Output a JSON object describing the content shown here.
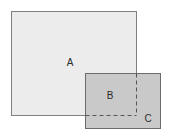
{
  "figure": {
    "background_color": "#ffffff",
    "width": 172,
    "height": 134
  },
  "chart_data": {
    "type": "diagram",
    "shapes": [
      {
        "id": "rect-a",
        "label": "A",
        "kind": "rectangle",
        "x": 11,
        "y": 11,
        "width": 125,
        "height": 104,
        "fill": "#ececec",
        "stroke": "#808080",
        "stroke_width": 1,
        "stroke_style": "solid"
      },
      {
        "id": "rect-bc",
        "label": "C",
        "kind": "rectangle",
        "x": 85,
        "y": 73,
        "width": 75,
        "height": 55,
        "fill": "#c9c9c9",
        "stroke": "#6b6b6b",
        "stroke_width": 1,
        "stroke_style": "solid"
      }
    ],
    "overlap_region": {
      "id": "region-b",
      "label": "B",
      "x": 85,
      "y": 73,
      "width": 51,
      "height": 42,
      "boundary_style": "dashed",
      "boundary_color": "#555555"
    },
    "dashed_lines": [
      {
        "id": "dashed-vertical",
        "orientation": "vertical",
        "x1": 136,
        "y1": 73,
        "x2": 136,
        "y2": 115,
        "color": "#555555",
        "dash_pattern": "4,3"
      },
      {
        "id": "dashed-horizontal",
        "orientation": "horizontal",
        "x1": 85,
        "y1": 115,
        "x2": 136,
        "y2": 115,
        "color": "#555555",
        "dash_pattern": "4,3"
      }
    ],
    "labels": [
      {
        "id": "label-a",
        "text": "A",
        "x": 70,
        "y": 63,
        "color": "#2b2b2b",
        "font_size": 10
      },
      {
        "id": "label-b",
        "text": "B",
        "x": 110,
        "y": 96,
        "color": "#2b2b2b",
        "font_size": 10
      },
      {
        "id": "label-c",
        "text": "C",
        "x": 148,
        "y": 119,
        "color": "#2b2b2b",
        "font_size": 10
      }
    ]
  }
}
